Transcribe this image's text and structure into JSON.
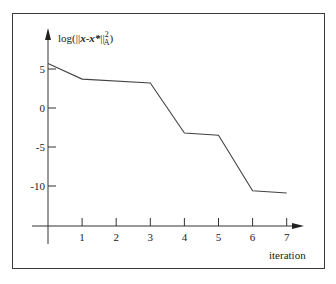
{
  "chart_data": {
    "type": "line",
    "title": "",
    "xlabel": "iteration",
    "ylabel": "log(||x-x*||²_A)",
    "ylabel_parts": {
      "prefix": "log(||",
      "x": "x",
      "minus": "-",
      "xstar": "x*",
      "norm": "||",
      "sup": "2",
      "sub": "A",
      "suffix": ")"
    },
    "x": [
      0,
      1,
      3,
      4,
      5,
      6,
      7
    ],
    "values": [
      5.7,
      3.7,
      3.2,
      -3.2,
      -3.5,
      -10.6,
      -10.9
    ],
    "x_ticks": [
      "1",
      "2",
      "3",
      "4",
      "5",
      "6",
      "7"
    ],
    "y_ticks": [
      "5",
      "0",
      "-5",
      "-10"
    ],
    "y_tick_values": [
      5,
      0,
      -5,
      -10
    ],
    "xlim": [
      0,
      7.5
    ],
    "ylim": [
      -14.5,
      9
    ],
    "grid": false,
    "legend": null
  }
}
